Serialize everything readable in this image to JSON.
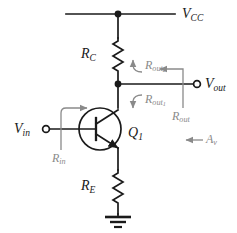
{
  "figure": {
    "kind": "circuit-schematic",
    "colors": {
      "wire": "#1a1a1a",
      "annotation": "#8a8a8a",
      "background": "#ffffff"
    }
  },
  "nodes": {
    "supply_rail_label": "V",
    "supply_rail_sub": "CC",
    "output_terminal_label": "V",
    "output_terminal_sub": "out",
    "input_terminal_label": "V",
    "input_terminal_sub": "in"
  },
  "components": {
    "collector_resistor": {
      "label": "R",
      "sub": "C"
    },
    "emitter_resistor": {
      "label": "R",
      "sub": "E"
    },
    "transistor": {
      "label": "Q",
      "sub": "1",
      "type": "npn"
    },
    "ground": {
      "name": "ground-symbol"
    }
  },
  "annotations": {
    "r_in": {
      "label": "R",
      "sub": "in",
      "arrow": "right"
    },
    "r_out_upper": {
      "label": "R",
      "sub": "out",
      "subsub": "2",
      "arrow": "up"
    },
    "r_out_lower": {
      "label": "R",
      "sub": "out",
      "subsub": "1",
      "arrow": "down"
    },
    "r_out_total": {
      "label": "R",
      "sub": "out",
      "arrow": "left"
    },
    "gain": {
      "label": "A",
      "sub": "v",
      "arrow": "left"
    }
  }
}
